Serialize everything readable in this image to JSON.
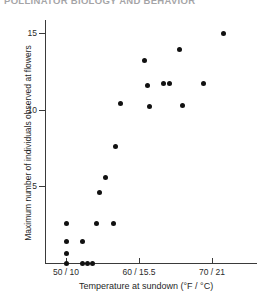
{
  "chart_data": {
    "type": "scatter",
    "title": "POLLINATOR BIOLOGY AND BEHAVIOR",
    "xlabel": "Temperature at sundown (°F / °C)",
    "ylabel": "Maximum number of individuals observed at flowers",
    "xlim": [
      47.5,
      73.5
    ],
    "ylim": [
      0,
      16.2
    ],
    "xticks": [
      50,
      60,
      70
    ],
    "xticklabels": [
      "50 / 10",
      "60 / 15.5",
      "70 / 21"
    ],
    "yticks": [
      5,
      10,
      15
    ],
    "yticklabels": [
      "5",
      "10",
      "15"
    ],
    "grid": false,
    "legend": null,
    "series": [
      {
        "name": "Individuals at flowers vs. sundown temperature",
        "marker": "filled-circle",
        "color": "#111111",
        "points": [
          {
            "x": 50.0,
            "y": 0.0
          },
          {
            "x": 50.0,
            "y": 0.6
          },
          {
            "x": 50.0,
            "y": 1.4
          },
          {
            "x": 50.0,
            "y": 2.6
          },
          {
            "x": 52.3,
            "y": 0.0
          },
          {
            "x": 53.0,
            "y": 0.0
          },
          {
            "x": 53.6,
            "y": 0.0
          },
          {
            "x": 52.3,
            "y": 1.4
          },
          {
            "x": 54.2,
            "y": 2.6
          },
          {
            "x": 56.5,
            "y": 2.6
          },
          {
            "x": 54.6,
            "y": 4.6
          },
          {
            "x": 55.4,
            "y": 5.6
          },
          {
            "x": 56.8,
            "y": 7.6
          },
          {
            "x": 57.4,
            "y": 10.4
          },
          {
            "x": 60.8,
            "y": 13.2
          },
          {
            "x": 61.2,
            "y": 11.6
          },
          {
            "x": 61.4,
            "y": 10.2
          },
          {
            "x": 63.4,
            "y": 11.7
          },
          {
            "x": 64.2,
            "y": 11.7
          },
          {
            "x": 65.6,
            "y": 13.9
          },
          {
            "x": 66.0,
            "y": 10.3
          },
          {
            "x": 68.8,
            "y": 11.7
          },
          {
            "x": 71.6,
            "y": 15.0
          }
        ]
      }
    ]
  },
  "axes": {
    "y_title": "Maximum number of individuals observed at flowers",
    "x_title": "Temperature at sundown (°F / °C)",
    "y_ticks": [
      {
        "label": "15"
      },
      {
        "label": "10"
      },
      {
        "label": "5"
      }
    ],
    "x_ticks": [
      {
        "label": "50 / 10"
      },
      {
        "label": "60 / 15.5"
      },
      {
        "label": "70 / 21"
      }
    ]
  },
  "header": {
    "title": "POLLINATOR BIOLOGY AND BEHAVIOR"
  },
  "style": {
    "marker_color": "#111111",
    "axis_color": "#3a3a3a",
    "background": "#ffffff"
  }
}
